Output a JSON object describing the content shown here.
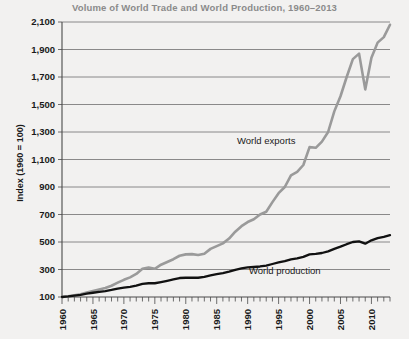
{
  "chart_data": {
    "type": "line",
    "title": "Volume of World Trade and World Production, 1960–2013",
    "xlabel": "",
    "ylabel": "Index (1960 = 100)",
    "xlim": [
      1960,
      2013
    ],
    "ylim": [
      100,
      2100
    ],
    "yticks": [
      100,
      300,
      500,
      700,
      900,
      1100,
      1300,
      1500,
      1700,
      1900,
      2100
    ],
    "ytick_labels": [
      "100",
      "300",
      "500",
      "700",
      "900",
      "1,100",
      "1,300",
      "1,500",
      "1,700",
      "1,900",
      "2,100"
    ],
    "xticks": [
      1960,
      1965,
      1970,
      1975,
      1980,
      1985,
      1990,
      1995,
      2000,
      2005,
      2010
    ],
    "xtick_labels": [
      "1960",
      "1965",
      "1970",
      "1975",
      "1980",
      "1985",
      "1990",
      "1995",
      "2000",
      "2005",
      "2010"
    ],
    "minor_xtick_step": 1,
    "grid": "horizontal",
    "legend_position": "inline-annotation",
    "x": [
      1960,
      1961,
      1962,
      1963,
      1964,
      1965,
      1966,
      1967,
      1968,
      1969,
      1970,
      1971,
      1972,
      1973,
      1974,
      1975,
      1976,
      1977,
      1978,
      1979,
      1980,
      1981,
      1982,
      1983,
      1984,
      1985,
      1986,
      1987,
      1988,
      1989,
      1990,
      1991,
      1992,
      1993,
      1994,
      1995,
      1996,
      1997,
      1998,
      1999,
      2000,
      2001,
      2002,
      2003,
      2004,
      2005,
      2006,
      2007,
      2008,
      2009,
      2010,
      2011,
      2012,
      2013
    ],
    "series": [
      {
        "name": "World exports",
        "color": "#9a9a9a",
        "values": [
          100,
          105,
          112,
          120,
          133,
          144,
          155,
          165,
          182,
          204,
          225,
          243,
          268,
          305,
          315,
          305,
          335,
          355,
          375,
          400,
          410,
          412,
          405,
          415,
          450,
          470,
          490,
          525,
          575,
          615,
          645,
          665,
          700,
          720,
          790,
          855,
          900,
          985,
          1010,
          1060,
          1190,
          1185,
          1230,
          1300,
          1450,
          1560,
          1700,
          1830,
          1870,
          1610,
          1840,
          1950,
          1990,
          2080
        ]
      },
      {
        "name": "World production",
        "color": "#111111",
        "values": [
          100,
          104,
          110,
          116,
          124,
          131,
          138,
          143,
          151,
          161,
          168,
          174,
          183,
          196,
          200,
          200,
          209,
          218,
          228,
          238,
          240,
          241,
          240,
          246,
          258,
          267,
          274,
          284,
          297,
          308,
          315,
          318,
          322,
          328,
          340,
          351,
          361,
          374,
          381,
          392,
          410,
          413,
          420,
          432,
          450,
          466,
          484,
          500,
          505,
          488,
          512,
          528,
          538,
          550
        ]
      }
    ],
    "annotations": [
      {
        "text": "World exports",
        "x": 1993,
        "y": 1215
      },
      {
        "text": "World production",
        "x": 1996,
        "y": 270
      }
    ]
  }
}
